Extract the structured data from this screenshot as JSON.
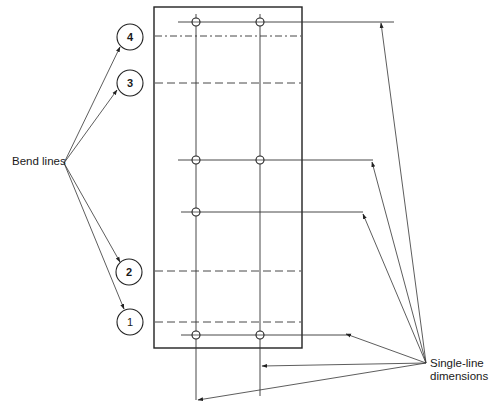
{
  "diagram": {
    "labels": {
      "bend_lines": "Bend lines",
      "single_line_1": "Single-line",
      "single_line_2": "dimensions"
    },
    "bend_callouts": [
      {
        "number": "4",
        "style": "dash-dot"
      },
      {
        "number": "3",
        "style": "dashed"
      },
      {
        "number": "2",
        "style": "dashed"
      },
      {
        "number": "1",
        "style": "dashed"
      }
    ],
    "plate": {
      "hole_rows": 4,
      "hole_columns": 2
    },
    "colors": {
      "line": "#222222",
      "background": "#ffffff"
    }
  }
}
